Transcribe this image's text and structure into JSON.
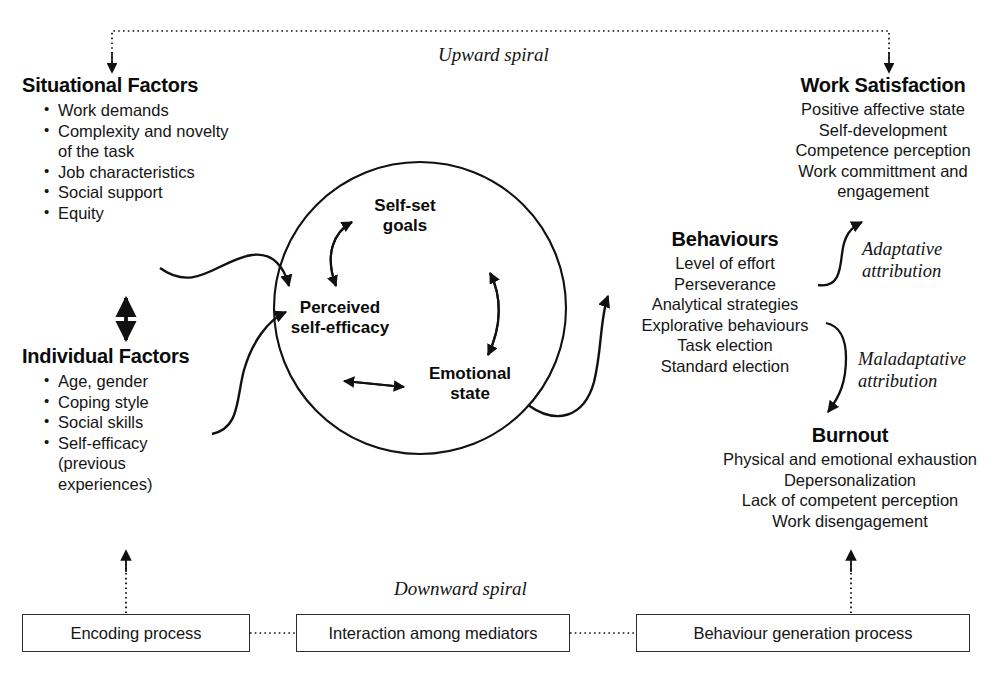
{
  "diagram": {
    "spiral_top_label": "Upward spiral",
    "spiral_bottom_label": "Downward spiral",
    "line_color": "#111111"
  },
  "situational_factors": {
    "heading": "Situational Factors",
    "items": [
      "Work demands",
      "Complexity and novelty",
      "of the task",
      "Job characteristics",
      "Social support",
      "Equity"
    ]
  },
  "individual_factors": {
    "heading": "Individual Factors",
    "items": [
      "Age, gender",
      "Coping style",
      "Social skills",
      "Self-efficacy",
      "(previous",
      "experiences)"
    ]
  },
  "core_cycle": {
    "nodes": [
      {
        "id": "self-set-goals",
        "line1": "Self-set",
        "line2": "goals"
      },
      {
        "id": "perceived-self-efficacy",
        "line1": "Perceived",
        "line2": "self-efficacy"
      },
      {
        "id": "emotional-state",
        "line1": "Emotional",
        "line2": "state"
      }
    ]
  },
  "behaviours": {
    "heading": "Behaviours",
    "items": [
      "Level of effort",
      "Perseverance",
      "Analytical strategies",
      "Explorative behaviours",
      "Task election",
      "Standard election"
    ]
  },
  "work_satisfaction": {
    "heading": "Work Satisfaction",
    "items": [
      "Positive affective state",
      "Self-development",
      "Competence perception",
      "Work committment and",
      "engagement"
    ]
  },
  "burnout": {
    "heading": "Burnout",
    "items": [
      "Physical and emotional exhaustion",
      "Depersonalization",
      "Lack of competent perception",
      "Work disengagement"
    ]
  },
  "attributions": {
    "adaptative": {
      "line1": "Adaptative",
      "line2": "attribution"
    },
    "maladaptative": {
      "line1": "Maladaptative",
      "line2": "attribution"
    }
  },
  "process_boxes": [
    {
      "id": "encoding-process",
      "label": "Encoding process"
    },
    {
      "id": "interaction-among-mediators",
      "label": "Interaction among mediators"
    },
    {
      "id": "behaviour-generation-process",
      "label": "Behaviour generation process"
    }
  ]
}
